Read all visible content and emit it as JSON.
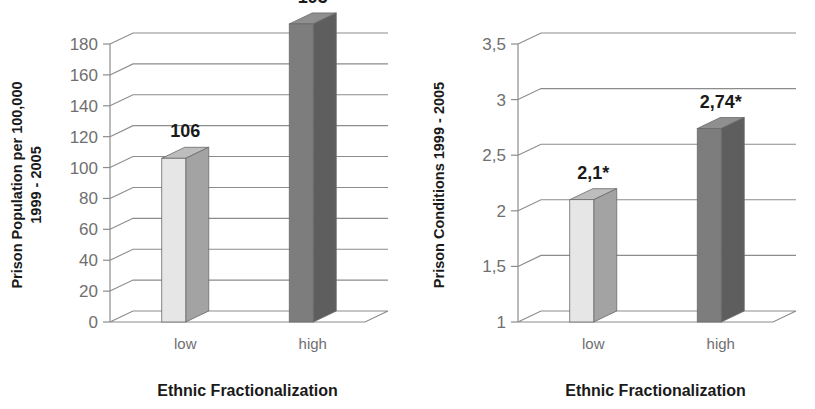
{
  "figure": {
    "width": 815,
    "height": 409,
    "background": "#ffffff",
    "panel_count": 2
  },
  "palette": {
    "bar_low_front": "#e6e6e6",
    "bar_low_side": "#a3a3a3",
    "bar_low_top": "#bdbdbd",
    "bar_high_front": "#7d7d7d",
    "bar_high_side": "#5e5e5e",
    "bar_high_top": "#8f8f8f",
    "grid": "#8c8c8c",
    "tick_text": "#6f6f6f",
    "label_text": "#1a1a1a"
  },
  "chart_data": [
    {
      "type": "bar",
      "id": "prison-population",
      "title": "",
      "xlabel": "Ethnic Fractionalization",
      "ylabel": "Prison Population per 100,000 1999 - 2005",
      "ylabel_lines": [
        "Prison Population per 100,000",
        "1999 - 2005"
      ],
      "categories": [
        "low",
        "high"
      ],
      "values": [
        106,
        193
      ],
      "value_labels": [
        "106",
        "193"
      ],
      "ylim": [
        0,
        190
      ],
      "yticks": [
        0,
        20,
        40,
        60,
        80,
        100,
        120,
        140,
        160,
        180
      ],
      "ytick_labels": [
        "0",
        "20",
        "40",
        "60",
        "80",
        "100",
        "120",
        "140",
        "160",
        "180"
      ],
      "grid": true,
      "legend": "none",
      "style": "3d-column"
    },
    {
      "type": "bar",
      "id": "prison-conditions",
      "title": "",
      "xlabel": "Ethnic Fractionalization",
      "ylabel": "Prison Conditions 1999 - 2005",
      "ylabel_lines": [
        "Prison Conditions 1999 - 2005"
      ],
      "categories": [
        "low",
        "high"
      ],
      "values": [
        2.1,
        2.74
      ],
      "value_labels": [
        "2,1*",
        "2,74*"
      ],
      "ylim": [
        1,
        3.6
      ],
      "yticks": [
        1,
        1.5,
        2,
        2.5,
        3,
        3.5
      ],
      "ytick_labels": [
        "1",
        "1,5",
        "2",
        "2,5",
        "3",
        "3,5"
      ],
      "grid": true,
      "legend": "none",
      "style": "3d-column"
    }
  ],
  "panels": [
    {
      "name": "left-panel",
      "chart_index": 0,
      "footer": "Ethnic Fractionalization"
    },
    {
      "name": "right-panel",
      "chart_index": 1,
      "footer": "Ethnic Fractionalization"
    }
  ],
  "annotations": {
    "significance_marker": "*"
  }
}
